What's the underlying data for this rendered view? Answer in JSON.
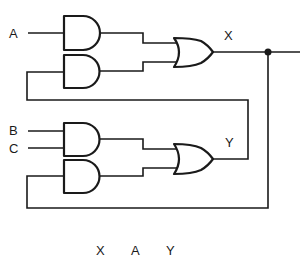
{
  "diagram": {
    "type": "logic-circuit",
    "inputs": [
      {
        "label": "A"
      },
      {
        "label": "B"
      },
      {
        "label": "C"
      }
    ],
    "outputs": [
      {
        "label": "X"
      },
      {
        "label": "Y"
      }
    ],
    "gates": [
      {
        "id": "and1",
        "type": "AND",
        "inputs": [
          "A"
        ],
        "output_to": "or1"
      },
      {
        "id": "and2",
        "type": "AND",
        "inputs": [
          "Y"
        ],
        "output_to": "or1"
      },
      {
        "id": "or1",
        "type": "OR",
        "output": "X"
      },
      {
        "id": "and3",
        "type": "AND",
        "inputs": [
          "B",
          "C"
        ],
        "output_to": "or2"
      },
      {
        "id": "and4",
        "type": "AND",
        "inputs": [
          "X"
        ],
        "output_to": "or2"
      },
      {
        "id": "or2",
        "type": "OR",
        "output": "Y"
      }
    ],
    "footer_text": [
      "X",
      "A",
      "Y"
    ],
    "stroke_color": "#1a1a1a",
    "background": "#ffffff"
  }
}
